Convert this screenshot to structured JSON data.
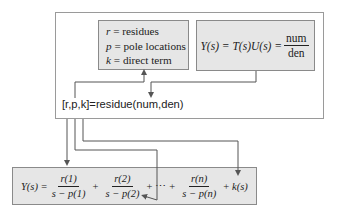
{
  "definitions": {
    "lines": [
      {
        "var": "r",
        "eq": "=",
        "desc": "residues"
      },
      {
        "var": "p",
        "eq": "=",
        "desc": "pole locations"
      },
      {
        "var": "k",
        "eq": "=",
        "desc": "direct term"
      }
    ]
  },
  "transfer_function": {
    "lhs": "Y(s) = T(s)U(s) =",
    "numerator": "num",
    "denominator": "den"
  },
  "matlab_call": "[r,p,k]=residue(num,den)",
  "partial_fraction": {
    "lhs": "Y(s) =",
    "terms": [
      {
        "num": "r(1)",
        "den": "s − p(1)"
      },
      {
        "num": "r(2)",
        "den": "s − p(2)"
      },
      {
        "num": "r(n)",
        "den": "s − p(n)"
      }
    ],
    "plus": "+",
    "ellipsis": "⋯",
    "tail": "k(s)"
  },
  "colors": {
    "box_fill": "#e6e6e6",
    "box_border": "#8a8a8a",
    "line": "#555555"
  }
}
